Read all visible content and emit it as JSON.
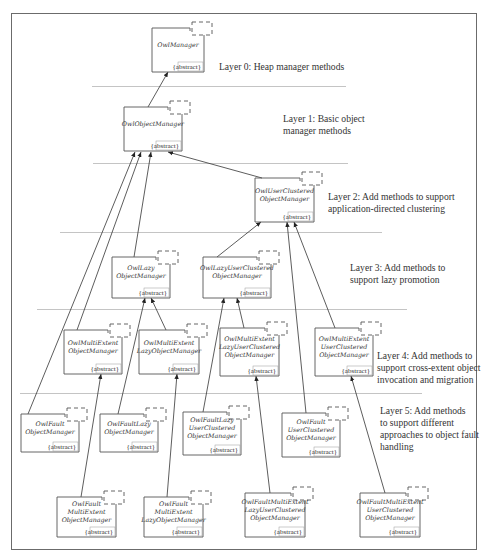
{
  "diagram": {
    "layers": [
      {
        "id": "layer0",
        "label": [
          "Layer 0: Heap manager methods"
        ]
      },
      {
        "id": "layer1",
        "label": [
          "Layer 1: Basic object",
          "manager methods"
        ]
      },
      {
        "id": "layer2",
        "label": [
          "Layer 2: Add methods to support",
          "application-directed clustering"
        ]
      },
      {
        "id": "layer3",
        "label": [
          "Layer 3: Add methods to",
          "support lazy promotion"
        ]
      },
      {
        "id": "layer4",
        "label": [
          "Layer 4: Add methods to",
          "support cross-extent object",
          "invocation and migration"
        ]
      },
      {
        "id": "layer5",
        "label": [
          "Layer 5: Add methods",
          "to support different",
          "approaches to object fault",
          "handling"
        ]
      }
    ],
    "classes": [
      {
        "id": "OwlManager",
        "lines": [
          "OwlManager"
        ],
        "stereotype": "{abstract}",
        "layer": 0
      },
      {
        "id": "OwlObjectManager",
        "lines": [
          "OwlObjectManager"
        ],
        "stereotype": "{abstract}",
        "layer": 1
      },
      {
        "id": "OwlUserClusteredObjectManager",
        "lines": [
          "OwlUserClustered",
          "ObjectManager"
        ],
        "stereotype": "{abstract}",
        "layer": 2
      },
      {
        "id": "OwlLazyObjectManager",
        "lines": [
          "OwlLazy",
          "ObjectManager"
        ],
        "stereotype": "{abstract}",
        "layer": 3
      },
      {
        "id": "OwlLazyUserClusteredObjectManager",
        "lines": [
          "OwlLazyUserClustered",
          "ObjectManager"
        ],
        "stereotype": "{abstract}",
        "layer": 3
      },
      {
        "id": "OwlMultiExtentObjectManager",
        "lines": [
          "OwlMultiExtent",
          "ObjectManager"
        ],
        "stereotype": "{abstract}",
        "layer": 4
      },
      {
        "id": "OwlMultiExtentLazyObjectManager",
        "lines": [
          "OwlMultiExtent",
          "LazyObjectManager"
        ],
        "stereotype": "{abstract}",
        "layer": 4
      },
      {
        "id": "OwlMultiExtentLazyUserClusteredObjectManager",
        "lines": [
          "OwlMultiExtent",
          "LazyUserClustered",
          "ObjectManager"
        ],
        "stereotype": "{abstract}",
        "layer": 4
      },
      {
        "id": "OwlMultiExtentUserClusteredObjectManager",
        "lines": [
          "OwlMultiExtent",
          "UserClustered",
          "ObjectManager"
        ],
        "stereotype": "{abstract}",
        "layer": 4
      },
      {
        "id": "OwlFaultObjectManager",
        "lines": [
          "OwlFault",
          "ObjectManager"
        ],
        "stereotype": "{abstract}",
        "layer": 5
      },
      {
        "id": "OwlFaultLazyObjectManager",
        "lines": [
          "OwlFaultLazy",
          "ObjectManager"
        ],
        "stereotype": "{abstract}",
        "layer": 5
      },
      {
        "id": "OwlFaultLazyUserClusteredObjectManager",
        "lines": [
          "OwlFaultLazy",
          "UserClustered",
          "ObjectManager"
        ],
        "stereotype": "{abstract}",
        "layer": 5
      },
      {
        "id": "OwlFaultUserClusteredObjectManager",
        "lines": [
          "OwlFault",
          "UserClustered",
          "ObjectManager"
        ],
        "stereotype": "{abstract}",
        "layer": 5
      },
      {
        "id": "OwlFaultMultiExtentObjectManager",
        "lines": [
          "OwlFault",
          "MultiExtent",
          "ObjectManager"
        ],
        "stereotype": "{abstract}",
        "layer": 5
      },
      {
        "id": "OwlFaultMultiExtentLazyObjectManager",
        "lines": [
          "OwlFault",
          "MultiExtent",
          "LazyObjectManager"
        ],
        "stereotype": "{abstract}",
        "layer": 5
      },
      {
        "id": "OwlFaultMultiExtentLazyUserClusteredObjectManager",
        "lines": [
          "OwlFaultMultiExtent",
          "LazyUserClustered",
          "ObjectManager"
        ],
        "stereotype": "{abstract}",
        "layer": 5
      },
      {
        "id": "OwlFaultMultiExtentUserClusteredObjectManager",
        "lines": [
          "OwlFaultMultiExtent",
          "UserClustered",
          "ObjectManager"
        ],
        "stereotype": "{abstract}",
        "layer": 5
      }
    ],
    "inheritance": [
      {
        "from": "OwlObjectManager",
        "to": "OwlManager"
      },
      {
        "from": "OwlUserClusteredObjectManager",
        "to": "OwlObjectManager"
      },
      {
        "from": "OwlLazyObjectManager",
        "to": "OwlObjectManager"
      },
      {
        "from": "OwlMultiExtentObjectManager",
        "to": "OwlObjectManager"
      },
      {
        "from": "OwlFaultObjectManager",
        "to": "OwlObjectManager"
      },
      {
        "from": "OwlLazyUserClusteredObjectManager",
        "to": "OwlUserClusteredObjectManager"
      },
      {
        "from": "OwlMultiExtentUserClusteredObjectManager",
        "to": "OwlUserClusteredObjectManager"
      },
      {
        "from": "OwlFaultUserClusteredObjectManager",
        "to": "OwlUserClusteredObjectManager"
      },
      {
        "from": "OwlMultiExtentLazyObjectManager",
        "to": "OwlLazyObjectManager"
      },
      {
        "from": "OwlFaultLazyObjectManager",
        "to": "OwlLazyObjectManager"
      },
      {
        "from": "OwlMultiExtentLazyUserClusteredObjectManager",
        "to": "OwlLazyUserClusteredObjectManager"
      },
      {
        "from": "OwlFaultLazyUserClusteredObjectManager",
        "to": "OwlLazyUserClusteredObjectManager"
      },
      {
        "from": "OwlFaultMultiExtentObjectManager",
        "to": "OwlMultiExtentObjectManager"
      },
      {
        "from": "OwlFaultMultiExtentLazyObjectManager",
        "to": "OwlMultiExtentLazyObjectManager"
      },
      {
        "from": "OwlFaultMultiExtentLazyUserClusteredObjectManager",
        "to": "OwlMultiExtentLazyUserClusteredObjectManager"
      },
      {
        "from": "OwlFaultMultiExtentUserClusteredObjectManager",
        "to": "OwlMultiExtentUserClusteredObjectManager"
      }
    ]
  }
}
